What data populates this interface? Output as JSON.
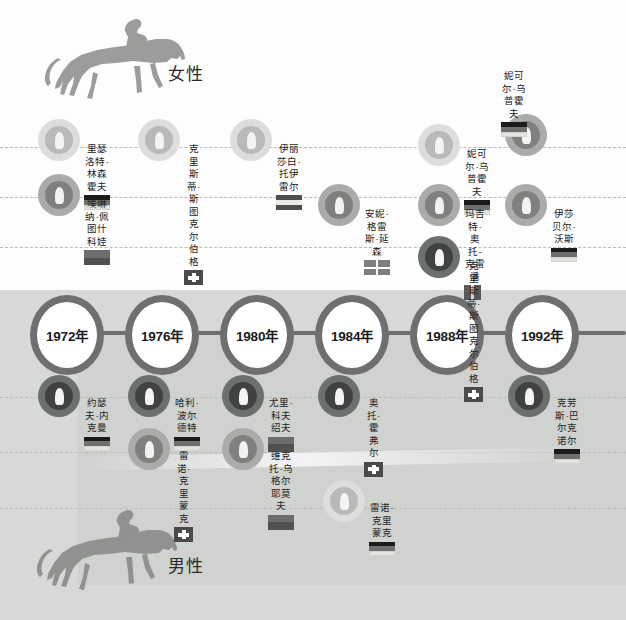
{
  "sections": {
    "women": {
      "caption": "女性"
    },
    "men": {
      "caption": "男性"
    }
  },
  "timeline": {
    "years": [
      {
        "label": "1972年"
      },
      {
        "label": "1976年"
      },
      {
        "label": "1980年"
      },
      {
        "label": "1984年"
      },
      {
        "label": "1988年"
      },
      {
        "label": "1992年"
      }
    ]
  },
  "colors": {
    "medal_light": "#d3d5d1",
    "medal_mid": "#9ea19c",
    "medal_dark": "#4c4f4c",
    "rail": "#6f6f6f",
    "band_men": "#d7d9d6",
    "dashed_guide": "#b9bcb8",
    "text": "#222222"
  },
  "women_entries": [
    {
      "name": "里瑟洛特·\n林森霍夫",
      "flag": "germany",
      "medal": "light"
    },
    {
      "name": "埃琳纳·佩\n图什科娃",
      "flag": "soviet",
      "medal": "mid"
    },
    {
      "name": "克里斯蒂·斯\n图克尔伯格",
      "flag": "swiss",
      "medal": "light"
    },
    {
      "name": "伊丽莎白·\n托伊雷尔",
      "flag": "austria-h",
      "medal": "light"
    },
    {
      "name": "安妮·格雷\n斯·延森",
      "flag": "blocks",
      "medal": "mid"
    },
    {
      "name": "妮可尔·乌\n普霍夫",
      "flag": "germany",
      "medal": "light"
    },
    {
      "name": "玛吉特·奥\n托-克雷潘",
      "flag": "vbars",
      "medal": "mid"
    },
    {
      "name": "克里斯蒂·斯\n图克尔伯格",
      "flag": "swiss",
      "medal": "dark"
    },
    {
      "name": "妮可尔·乌\n普霍夫",
      "flag": "germany",
      "medal": "mid"
    },
    {
      "name": "伊莎贝尔·\n沃斯",
      "flag": "germany",
      "medal": "mid"
    }
  ],
  "men_entries": [
    {
      "name": "约瑟夫·内\n克曼",
      "flag": "germany",
      "medal": "dark"
    },
    {
      "name": "哈利·波尔\n德特",
      "flag": "germany",
      "medal": "dark"
    },
    {
      "name": "雷诺·克里\n蒙克",
      "flag": "swiss",
      "medal": "mid"
    },
    {
      "name": "尤里·科夫\n绍夫",
      "flag": "soviet",
      "medal": "dark"
    },
    {
      "name": "维克托·乌\n格尔耶莫夫",
      "flag": "soviet",
      "medal": "mid"
    },
    {
      "name": "奥托·霍弗尔",
      "flag": "swiss",
      "medal": "dark"
    },
    {
      "name": "雷诺·克里\n蒙克",
      "flag": "germany",
      "medal": "light"
    },
    {
      "name": "克劳斯·巴\n尔克诺尔",
      "flag": "germany",
      "medal": "dark"
    }
  ]
}
